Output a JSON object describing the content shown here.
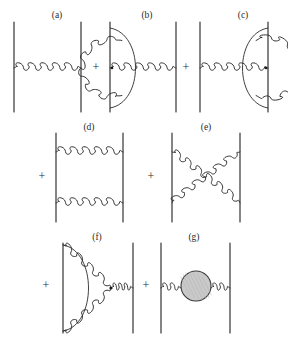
{
  "figure": {
    "background_color": "#ffffff",
    "line_color": "#2b2b2b",
    "blob_fill_color": "#c9c9c9",
    "blob_stroke_color": "#3a3a3a",
    "width": 288,
    "height": 339
  },
  "operators": [
    {
      "id": "plus-1",
      "symbol": "+",
      "x": 96,
      "y": 68,
      "after_panel": "a"
    },
    {
      "id": "plus-2",
      "symbol": "+",
      "x": 186,
      "y": 68,
      "after_panel": "b"
    },
    {
      "id": "plus-3",
      "symbol": "+",
      "x": 42,
      "y": 177,
      "after_panel": "c"
    },
    {
      "id": "plus-4",
      "symbol": "+",
      "x": 151,
      "y": 177,
      "after_panel": "d"
    },
    {
      "id": "plus-5",
      "symbol": "+",
      "x": 46,
      "y": 286,
      "after_panel": "e"
    },
    {
      "id": "plus-6",
      "symbol": "+",
      "x": 146,
      "y": 286,
      "after_panel": "f"
    }
  ],
  "panels": [
    {
      "id": "a",
      "label": "(a)",
      "label_x": 57,
      "label_y": 18,
      "description": "tree-level single gluon exchange between two quark lines",
      "left_line_x": 14,
      "right_line_x": 81,
      "line_top_y": 22,
      "line_bottom_y": 112,
      "gluon_y": 68,
      "gluon_coils": 5,
      "has_blob": false
    },
    {
      "id": "b",
      "label": "(b)",
      "label_x": 147,
      "label_y": 18,
      "description": "vertex correction loop on the left quark line",
      "left_line_x": 110,
      "right_line_x": 176,
      "line_top_y": 22,
      "line_bottom_y": 112,
      "gluon_y": 68,
      "gluon_coils": 5,
      "loop_side": "left",
      "has_blob": false
    },
    {
      "id": "c",
      "label": "(c)",
      "label_x": 243,
      "label_y": 18,
      "description": "vertex correction loop on the right quark line",
      "left_line_x": 200,
      "right_line_x": 268,
      "line_top_y": 22,
      "line_bottom_y": 112,
      "gluon_y": 68,
      "gluon_coils": 5,
      "loop_side": "right",
      "has_blob": false
    },
    {
      "id": "d",
      "label": "(d)",
      "label_x": 89,
      "label_y": 130,
      "description": "box diagram with two parallel gluon exchanges",
      "left_line_x": 56,
      "right_line_x": 123,
      "line_top_y": 133,
      "line_bottom_y": 222,
      "gluon_top_y": 152,
      "gluon_bottom_y": 203,
      "gluon_coils": 5,
      "has_blob": false
    },
    {
      "id": "e",
      "label": "(e)",
      "label_x": 206,
      "label_y": 130,
      "description": "crossed box diagram with two crossing gluon exchanges",
      "left_line_x": 172,
      "right_line_x": 240,
      "line_top_y": 133,
      "line_bottom_y": 222,
      "gluon_top_y": 152,
      "gluon_bottom_y": 203,
      "gluon_coils": 6,
      "has_blob": false
    },
    {
      "id": "f",
      "label": "(f)",
      "label_x": 97,
      "label_y": 240,
      "description": "triple gluon vertex correction on the left quark line",
      "left_line_x": 63,
      "right_line_x": 133,
      "line_top_y": 243,
      "line_bottom_y": 333,
      "gluon_y": 288,
      "gluon_coils": 3,
      "has_blob": false
    },
    {
      "id": "g",
      "label": "(g)",
      "label_x": 194,
      "label_y": 240,
      "description": "gluon self-energy insertion shown as a shaded blob",
      "left_line_x": 161,
      "right_line_x": 230,
      "line_top_y": 243,
      "line_bottom_y": 333,
      "gluon_y": 288,
      "gluon_coils": 2,
      "has_blob": true,
      "blob_cx": 196,
      "blob_cy": 286,
      "blob_r": 15
    }
  ]
}
